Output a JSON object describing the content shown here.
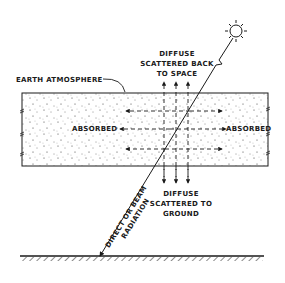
{
  "diagram": {
    "labels": {
      "atmosphere": "EARTH ATMOSPHERE",
      "scattered_up_line1": "DIFFUSE",
      "scattered_up_line2": "SCATTERED BACK",
      "scattered_up_line3": "TO SPACE",
      "absorbed_left": "ABSORBED",
      "absorbed_right": "ABSORBED",
      "scattered_down_line1": "DIFFUSE",
      "scattered_down_line2": "SCATTERED TO",
      "scattered_down_line3": "GROUND",
      "beam_line1": "DIRECT OR BEAM",
      "beam_line2": "RADIATION"
    },
    "elements": {
      "sun": "sun-icon",
      "atmosphere_layer": "dotted rectangle",
      "ground": "hatched ground line"
    },
    "colors": {
      "ink": "#1a1a1a",
      "background": "#ffffff"
    }
  }
}
